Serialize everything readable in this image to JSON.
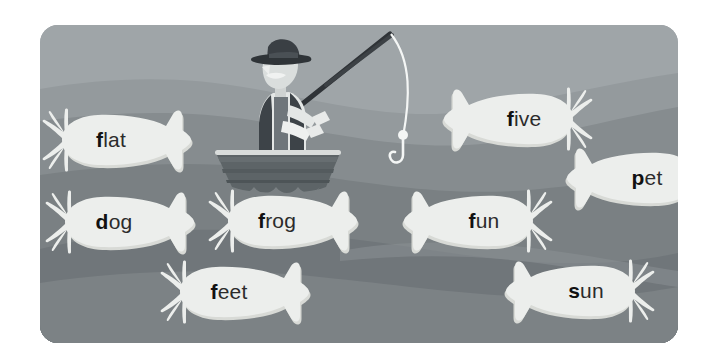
{
  "scene": {
    "title": "Fishing for words",
    "card": {
      "x": 40,
      "y": 25,
      "width": 638,
      "height": 318,
      "corner_radius": 18
    },
    "colors": {
      "page_background": "#ffffff",
      "water_top": "#9fa5a8",
      "water_band_2": "#8d9396",
      "water_band_3": "#7e8487",
      "water_band_4": "#6f7578",
      "water_band_5": "#7b8184",
      "fish_body": "#eceeec",
      "fish_shadow": "#d8dad6",
      "text_dark": "#2b2b2b",
      "text_lead_letter": "#111111",
      "boat_hull": "#5d6467",
      "boat_rim": "#d9dcdb",
      "hat_dark": "#3a3f44",
      "vest_dark": "#3d4348",
      "shirt_light": "#e4e7e6",
      "skin_light": "#dadedd",
      "rod_dark": "#2f3337",
      "line_white": "#f4f6f5"
    }
  },
  "fisherman": {
    "name": "fisherman-in-rowboat",
    "parts": [
      "hat",
      "face",
      "mustache",
      "shirt",
      "vest",
      "arms",
      "hands",
      "fishing-rod",
      "fishing-line",
      "bobber",
      "hook",
      "rowboat"
    ]
  },
  "fish_list": [
    {
      "id": "fish-flat",
      "word": "flat",
      "lead": "f",
      "rest": "lat",
      "x": 42,
      "y": 104,
      "facing": "right"
    },
    {
      "id": "fish-five",
      "word": "five",
      "lead": "f",
      "rest": "ive",
      "x": 443,
      "y": 83,
      "facing": "left"
    },
    {
      "id": "fish-pet",
      "word": "pet",
      "lead": "p",
      "rest": "et",
      "x": 566,
      "y": 142,
      "facing": "left"
    },
    {
      "id": "fish-dog",
      "word": "dog",
      "lead": "d",
      "rest": "og",
      "x": 45,
      "y": 186,
      "facing": "right"
    },
    {
      "id": "fish-frog",
      "word": "frog",
      "lead": "f",
      "rest": "rog",
      "x": 208,
      "y": 185,
      "facing": "right"
    },
    {
      "id": "fish-fun",
      "word": "fun",
      "lead": "f",
      "rest": "un",
      "x": 403,
      "y": 185,
      "facing": "left"
    },
    {
      "id": "fish-feet",
      "word": "feet",
      "lead": "f",
      "rest": "eet",
      "x": 160,
      "y": 256,
      "facing": "right"
    },
    {
      "id": "fish-sun",
      "word": "sun",
      "lead": "s",
      "rest": "un",
      "x": 505,
      "y": 255,
      "facing": "left"
    }
  ]
}
